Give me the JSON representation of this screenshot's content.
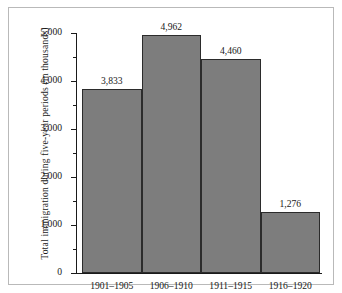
{
  "chart_data": {
    "type": "bar",
    "title": "",
    "subtitle": "",
    "xlabel": "",
    "ylabel": "Total immigration during five-year periods (in thousands)",
    "categories": [
      "1901–1905",
      "1906–1910",
      "1911–1915",
      "1916–1920"
    ],
    "values": [
      3833,
      4962,
      4460,
      1276
    ],
    "value_labels": [
      "3,833",
      "4,962",
      "4,460",
      "1,276"
    ],
    "ylim": [
      0,
      5000
    ],
    "ytick_values": [
      0,
      1000,
      2000,
      3000,
      4000,
      5000
    ],
    "ytick_labels": [
      "0",
      "1,000",
      "2,000",
      "3,000",
      "4,000",
      "5,000"
    ],
    "yminor_tick_values": [
      500,
      1500,
      2500,
      3500,
      4500
    ],
    "grid": false,
    "legend": null,
    "legend_position": "none",
    "bar_color": "#7d7d7d",
    "bar_edge_color": "#2b2b2b",
    "axis_color": "#1a1a1a",
    "frame_color": "#b9b9b9",
    "background_color": "#ffffff"
  }
}
